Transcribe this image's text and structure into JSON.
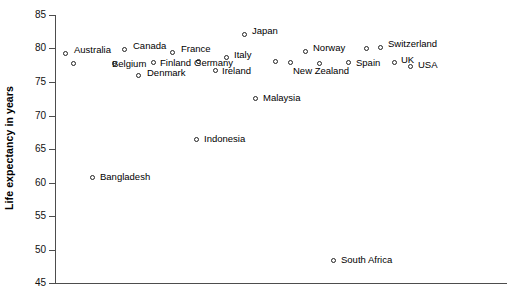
{
  "chart_data": {
    "type": "scatter",
    "title": "",
    "xlabel": "",
    "ylabel": "Life expectancy in years",
    "ylim": [
      45,
      85
    ],
    "yticks": [
      85,
      80,
      75,
      70,
      65,
      60,
      55,
      50,
      45
    ],
    "grid": false,
    "legend": "none",
    "x_axis_visible_ticks": false,
    "points": [
      {
        "label": "Australia",
        "y": 80.0,
        "px": 65,
        "py": 53,
        "lx": 74,
        "ly": 45
      },
      {
        "label": "Belgium",
        "y": 78.5,
        "px": 73,
        "py": 63,
        "lx": 112,
        "ly": 59
      },
      {
        "label": "Canada",
        "y": 80.3,
        "px": 124,
        "py": 49,
        "lx": 133,
        "ly": 41
      },
      {
        "label": "",
        "y": 78.5,
        "px": 114,
        "py": 63,
        "lx": 0,
        "ly": 0
      },
      {
        "label": "Finland",
        "y": 78.6,
        "px": 153,
        "py": 62,
        "lx": 160,
        "ly": 58
      },
      {
        "label": "Denmark",
        "y": 76.6,
        "px": 138,
        "py": 75,
        "lx": 147,
        "ly": 68
      },
      {
        "label": "France",
        "y": 80.1,
        "px": 172,
        "py": 52,
        "lx": 181,
        "ly": 44
      },
      {
        "label": "Germany",
        "y": 78.7,
        "px": 198,
        "py": 61,
        "lx": 194,
        "ly": 58
      },
      {
        "label": "Ireland",
        "y": 77.2,
        "px": 215,
        "py": 70,
        "lx": 222,
        "ly": 66
      },
      {
        "label": "Italy",
        "y": 78.9,
        "px": 226,
        "py": 57,
        "lx": 234,
        "ly": 50
      },
      {
        "label": "Japan",
        "y": 82.4,
        "px": 244,
        "py": 34,
        "lx": 252,
        "ly": 26
      },
      {
        "label": "",
        "y": 78.2,
        "px": 275,
        "py": 61,
        "lx": 0,
        "ly": 0
      },
      {
        "label": "",
        "y": 78.0,
        "px": 290,
        "py": 62,
        "lx": 0,
        "ly": 0
      },
      {
        "label": "Norway",
        "y": 79.5,
        "px": 305,
        "py": 51,
        "lx": 313,
        "ly": 43
      },
      {
        "label": "New Zealand",
        "y": 78.0,
        "px": 319,
        "py": 63,
        "lx": 293,
        "ly": 66
      },
      {
        "label": "Spain",
        "y": 78.0,
        "px": 348,
        "py": 62,
        "lx": 356,
        "ly": 58
      },
      {
        "label": "",
        "y": 79.8,
        "px": 366,
        "py": 48,
        "lx": 0,
        "ly": 0
      },
      {
        "label": "Switzerland",
        "y": 80.1,
        "px": 380,
        "py": 47,
        "lx": 388,
        "ly": 39
      },
      {
        "label": "UK",
        "y": 78.0,
        "px": 394,
        "py": 62,
        "lx": 401,
        "ly": 55
      },
      {
        "label": "USA",
        "y": 77.4,
        "px": 410,
        "py": 66,
        "lx": 418,
        "ly": 60
      },
      {
        "label": "Malaysia",
        "y": 72.2,
        "px": 255,
        "py": 98,
        "lx": 263,
        "ly": 93
      },
      {
        "label": "Indonesia",
        "y": 65.8,
        "px": 196,
        "py": 139,
        "lx": 204,
        "ly": 134
      },
      {
        "label": "Bangladesh",
        "y": 60.9,
        "px": 92,
        "py": 177,
        "lx": 100,
        "ly": 172
      },
      {
        "label": "South Africa",
        "y": 48.5,
        "px": 333,
        "py": 260,
        "lx": 341,
        "ly": 255
      }
    ]
  },
  "axis": {
    "y_title": "Life expectancy in years",
    "tick_labels": [
      "85",
      "80",
      "75",
      "70",
      "65",
      "60",
      "55",
      "50",
      "45"
    ],
    "tick_pixel_y": [
      15,
      48,
      82,
      116,
      149,
      183,
      216,
      250,
      283
    ]
  }
}
